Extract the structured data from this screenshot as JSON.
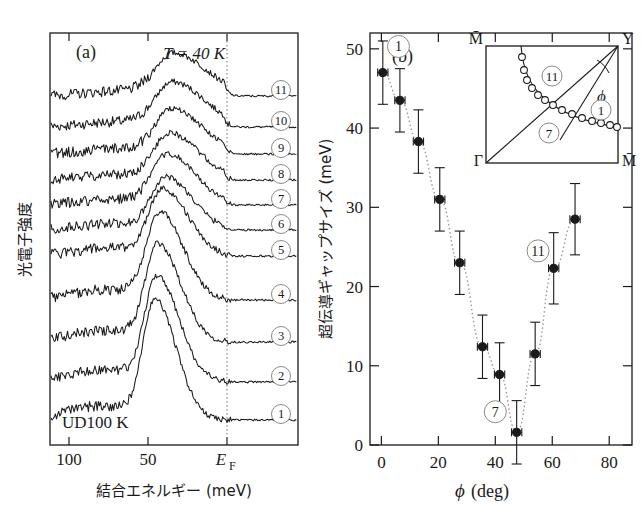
{
  "figure": {
    "background": "#ffffff",
    "ink": "#1a1a1a"
  },
  "panel_a": {
    "label": "(a)",
    "annotation_temperature": "T = 40 K",
    "annotation_sample": "UD100 K",
    "y_axis_title": "光電子強度",
    "x_axis_title": "結合エネルギー (meV)",
    "x_ticks": [
      "100",
      "50",
      "EF"
    ],
    "x_tick_ef_base": "E",
    "x_tick_ef_sub": "F",
    "curve_labels": [
      "①",
      "②",
      "③",
      "④",
      "⑤",
      "⑥",
      "⑦",
      "⑧",
      "⑨",
      "⑩",
      "⑪"
    ],
    "fermi_line_style": "dotted",
    "n_curves": 11
  },
  "panel_b": {
    "label": "(b)",
    "y_axis_title": "超伝導ギャップサイズ (meV)",
    "x_axis_title": "ϕ (deg)",
    "x_axis_symbol": "ϕ",
    "x_axis_unit": "(deg)",
    "y_ticks": [
      "0",
      "10",
      "20",
      "30",
      "40",
      "50"
    ],
    "x_ticks": [
      "0",
      "20",
      "40",
      "60",
      "80"
    ],
    "xlim": [
      -4,
      88
    ],
    "ylim": [
      0,
      52
    ],
    "marker_labels": {
      "first": "①",
      "middle": "⑦",
      "last": "⑪"
    }
  },
  "chart_data": {
    "type": "scatter",
    "title": "",
    "xlabel": "ϕ (deg)",
    "ylabel": "超伝導ギャップサイズ (meV)",
    "xlim": [
      -4,
      88
    ],
    "ylim": [
      0,
      52
    ],
    "xticks": [
      0,
      20,
      40,
      60,
      80
    ],
    "yticks": [
      0,
      10,
      20,
      30,
      40,
      50
    ],
    "grid": false,
    "legend": "none",
    "series": [
      {
        "name": "superconducting gap vs phi",
        "x": [
          0.5,
          6.5,
          13.0,
          20.5,
          27.5,
          35.5,
          41.5,
          47.5,
          54.0,
          60.5,
          68.0
        ],
        "y": [
          47.0,
          43.5,
          38.3,
          31.0,
          23.0,
          12.4,
          8.9,
          1.6,
          11.5,
          22.3,
          28.5
        ],
        "yerr": [
          4.0,
          4.0,
          4.0,
          4.0,
          4.0,
          4.0,
          4.0,
          4.0,
          4.0,
          4.5,
          4.5
        ],
        "xerr": [
          1.8,
          1.8,
          1.8,
          1.8,
          1.8,
          1.8,
          1.8,
          1.8,
          1.8,
          1.8,
          1.8
        ],
        "marker": "filled-circle",
        "connector": "dotted"
      }
    ],
    "annotations": [
      {
        "text": "①",
        "x": 6.0,
        "y": 50.3
      },
      {
        "text": "⑦",
        "x": 40.0,
        "y": 4.2
      },
      {
        "text": "⑪",
        "x": 55.0,
        "y": 24.5
      },
      {
        "text": "(b)",
        "x": 6.0,
        "y": 51.8
      }
    ]
  },
  "inset": {
    "corner_top_left": "M̄",
    "corner_top_right": "Y",
    "corner_bottom_left": "Γ",
    "corner_bottom_right": "M̄",
    "angle_symbol": "ϕ",
    "fs_point_labels": [
      "⑪",
      "⑦",
      "①"
    ],
    "n_fs_points": 14,
    "description": "Brillouin-zone quadrant with Fermi-surface arc and angle phi measured at Y"
  }
}
